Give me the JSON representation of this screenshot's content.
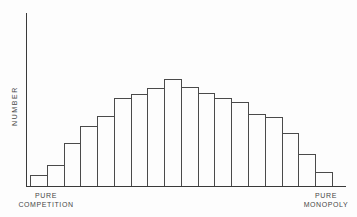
{
  "chart_data": {
    "type": "bar",
    "title": "",
    "ylabel": "NUMBER",
    "xlabel_left": "PURE COMPETITION",
    "xlabel_right": "PURE MONOPOLY",
    "x_axis_note": "continuum of market structures from pure competition (left) to pure monopoly (right), no tick labels",
    "values": [
      10,
      20,
      40,
      56,
      65,
      82,
      86,
      91,
      100,
      92,
      87,
      82,
      78,
      67,
      64,
      49,
      30,
      13
    ],
    "bar_count": 18,
    "ylim": [
      0,
      100
    ],
    "grid": false,
    "legend": false,
    "bar_fill": "#fdfdfd",
    "bar_border": "#4a4a4a",
    "axis_color": "#3a3a3a",
    "text_color": "#474747"
  },
  "labels": {
    "y_axis": "NUMBER",
    "x_left_line1": "PURE",
    "x_left_line2": "COMPETITION",
    "x_right_line1": "PURE",
    "x_right_line2": "MONOPOLY"
  }
}
